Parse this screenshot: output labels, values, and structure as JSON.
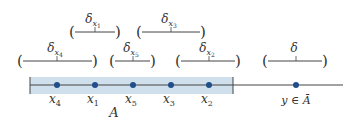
{
  "diagram": {
    "set_label": "A",
    "colors": {
      "shade": "#cfe0ec",
      "line": "#444444",
      "dot": "#1f4e8c",
      "text": "#333333"
    },
    "points": [
      {
        "id": "x4",
        "base": "x",
        "sub": "4",
        "x": 57
      },
      {
        "id": "x1",
        "base": "x",
        "sub": "1",
        "x": 95
      },
      {
        "id": "x5",
        "base": "x",
        "sub": "5",
        "x": 133
      },
      {
        "id": "x3",
        "base": "x",
        "sub": "3",
        "x": 171
      },
      {
        "id": "x2",
        "base": "x",
        "sub": "2",
        "x": 209
      }
    ],
    "outside_point": {
      "label": "y ∈ Ā",
      "x": 296
    },
    "neighborhoods": [
      {
        "label_base": "δ",
        "label_sub": "x",
        "label_subsub": "1",
        "left": 72,
        "right": 118,
        "center": 95,
        "row": 1
      },
      {
        "label_base": "δ",
        "label_sub": "x",
        "label_subsub": "3",
        "left": 139,
        "right": 203,
        "center": 171,
        "row": 1
      },
      {
        "label_base": "δ",
        "label_sub": "x",
        "label_subsub": "4",
        "left": 20,
        "right": 95,
        "center": 57,
        "row": 2
      },
      {
        "label_base": "δ",
        "label_sub": "x",
        "label_subsub": "5",
        "left": 112,
        "right": 153,
        "center": 133,
        "row": 2
      },
      {
        "label_base": "δ",
        "label_sub": "x",
        "label_subsub": "2",
        "left": 178,
        "right": 238,
        "center": 209,
        "row": 2
      },
      {
        "label_base": "δ",
        "label_sub": "",
        "label_subsub": "",
        "left": 265,
        "right": 325,
        "center": 296,
        "row": 2
      }
    ]
  }
}
